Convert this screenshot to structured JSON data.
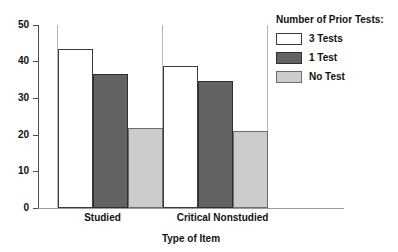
{
  "chart_data": {
    "type": "bar",
    "title": "",
    "xlabel": "Type of Item",
    "ylabel": "",
    "categories": [
      "Studied",
      "Critical Nonstudied"
    ],
    "series": [
      {
        "name": "3 Tests",
        "values": [
          43.5,
          38.8
        ],
        "color": "#ffffff"
      },
      {
        "name": "1 Test",
        "values": [
          36.5,
          34.8
        ],
        "color": "#636363"
      },
      {
        "name": "No Test",
        "values": [
          21.8,
          21.0
        ],
        "color": "#cccccc"
      }
    ],
    "ylim": [
      0,
      50
    ],
    "yticks": [
      0,
      10,
      20,
      30,
      40,
      50
    ],
    "ytick_labels": [
      "0",
      "10",
      "20",
      "30",
      "40",
      "50"
    ],
    "grid": false,
    "legend_position": "top-right",
    "legend_title": "Number of Prior Tests:"
  },
  "axes": {
    "y_tick_labels": [
      "50",
      "40",
      "30",
      "20",
      "10",
      "0"
    ],
    "x_categories": [
      "Studied",
      "Critical Nonstudied"
    ],
    "x_axis_title": "Type of Item"
  },
  "legend": {
    "title": "Number of Prior Tests:",
    "items": [
      {
        "label": "3 Tests"
      },
      {
        "label": "1 Test"
      },
      {
        "label": "No Test"
      }
    ]
  },
  "colors": {
    "series_3_tests": "#ffffff",
    "series_1_test": "#636363",
    "series_no_test": "#cccccc",
    "axis": "#4d4d4d",
    "text": "#111111",
    "background": "#ffffff"
  }
}
